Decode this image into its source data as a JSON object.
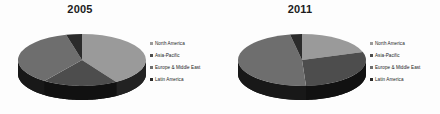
{
  "page": {
    "background": "#fdfdfd",
    "width": 440,
    "height": 114
  },
  "palette": {
    "north_america": "#9a9a9a",
    "asia_pacific": "#4d4d4d",
    "europe_middle_east": "#6e6e6e",
    "latin_america": "#2b2b2b",
    "pie_base": "#111111",
    "text": "#1c1c1c"
  },
  "legend": {
    "items": [
      {
        "label": "North America",
        "color": "#9a9a9a"
      },
      {
        "label": "Asia-Pacific",
        "color": "#4d4d4d"
      },
      {
        "label": "Europe & Middle East",
        "color": "#6e6e6e"
      },
      {
        "label": "Latin America",
        "color": "#2b2b2b"
      }
    ]
  },
  "chart_data": [
    {
      "type": "pie",
      "title": "2005",
      "three_d": true,
      "categories": [
        "North America",
        "Asia-Pacific",
        "Europe & Middle East",
        "Latin America"
      ],
      "values": [
        41,
        19,
        36,
        4
      ],
      "colors": [
        "#9a9a9a",
        "#4d4d4d",
        "#6e6e6e",
        "#2b2b2b"
      ],
      "xlabel": "",
      "ylabel": "",
      "legend_position": "right",
      "grid": false
    },
    {
      "type": "pie",
      "title": "2011",
      "three_d": true,
      "categories": [
        "North America",
        "Asia-Pacific",
        "Europe & Middle East",
        "Latin America"
      ],
      "values": [
        20,
        29,
        48,
        3
      ],
      "colors": [
        "#9a9a9a",
        "#4d4d4d",
        "#6e6e6e",
        "#2b2b2b"
      ],
      "xlabel": "",
      "ylabel": "",
      "legend_position": "right",
      "grid": false
    }
  ]
}
